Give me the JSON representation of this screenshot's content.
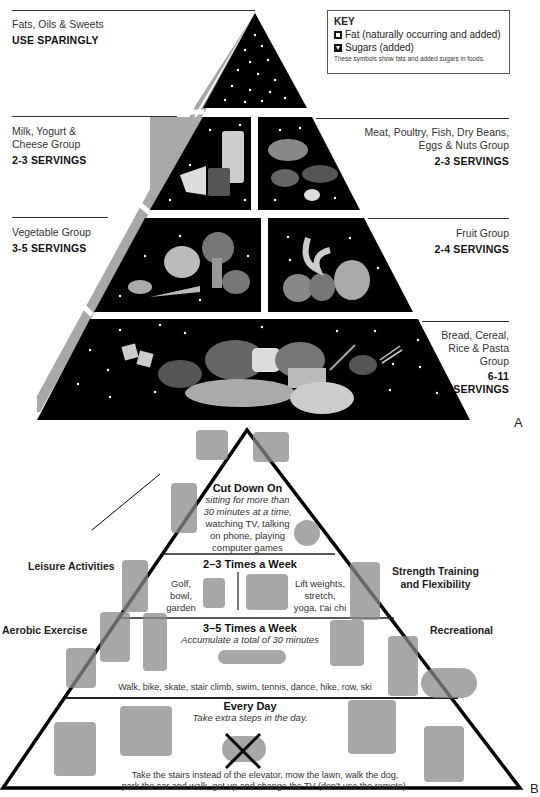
{
  "pyramid_a": {
    "letter": "A",
    "key": {
      "title": "KEY",
      "items": [
        {
          "icon": "fat-symbol-icon",
          "label": "Fat (naturally occurring and added)"
        },
        {
          "icon": "sugar-symbol-icon",
          "label": "Sugars (added)"
        }
      ],
      "note": "These symbols show fats and added sugars in foods."
    },
    "tiers": [
      {
        "name": "Fats, Oils & Sweets",
        "servings": "USE SPARINGLY",
        "side": "left"
      },
      {
        "name": "Milk, Yogurt & Cheese Group",
        "servings": "2-3 SERVINGS",
        "side": "left"
      },
      {
        "name": "Meat, Poultry, Fish, Dry Beans, Eggs & Nuts Group",
        "servings": "2-3 SERVINGS",
        "side": "right"
      },
      {
        "name": "Vegetable Group",
        "servings": "3-5 SERVINGS",
        "side": "left"
      },
      {
        "name": "Fruit Group",
        "servings": "2-4 SERVINGS",
        "side": "right"
      },
      {
        "name": "Bread, Cereal, Rice & Pasta Group",
        "servings": "6-11 SERVINGS",
        "side": "right"
      }
    ],
    "labels": {
      "fats_l1": "Fats, Oils & Sweets",
      "milk_l1": "Milk, Yogurt &",
      "milk_l2": "Cheese Group",
      "meat_l1": "Meat, Poultry, Fish, Dry Beans,",
      "meat_l2": "Eggs & Nuts Group",
      "veg_l1": "Vegetable Group",
      "fruit_l1": "Fruit Group",
      "bread_l1": "Bread, Cereal,",
      "bread_l2": "Rice & Pasta",
      "bread_l3": "Group",
      "bread_s1": "6-11",
      "bread_s2": "SERVINGS"
    },
    "colors": {
      "tier_fill": "#000000",
      "side_face": "#a8a8a8",
      "speck": "#ffffff"
    }
  },
  "pyramid_b": {
    "letter": "B",
    "tiers": [
      {
        "heading": "Cut Down On",
        "italic": "sitting for more than",
        "italic2": "30 minutes at a time,",
        "body": [
          "watching TV, talking",
          "on phone, playing",
          "computer games"
        ]
      },
      {
        "heading": "2–3 Times a Week",
        "left": [
          "Golf,",
          "bowl,",
          "garden"
        ],
        "right": [
          "Lift weights,",
          "stretch,",
          "yoga, t'ai chi"
        ]
      },
      {
        "heading": "3–5 Times a Week",
        "italic": "Accumulate a total of 30 minutes",
        "body": "Walk, bike, skate, stair climb, swim, tennis, dance, hike, row, ski"
      },
      {
        "heading": "Every Day",
        "italic": "Take extra steps in the day.",
        "body": [
          "Take the stairs instead of the elevator, mow the lawn, walk the dog,",
          "park the car and walk, get up and change the TV (don't use the remote)."
        ]
      }
    ],
    "side_labels": {
      "leisure": "Leisure Activities",
      "strength_l1": "Strength Training",
      "strength_l2": "and Flexibility",
      "aerobic": "Aerobic Exercise",
      "recreational": "Recreational"
    },
    "colors": {
      "outline": "#000000",
      "fill": "#ffffff"
    }
  }
}
